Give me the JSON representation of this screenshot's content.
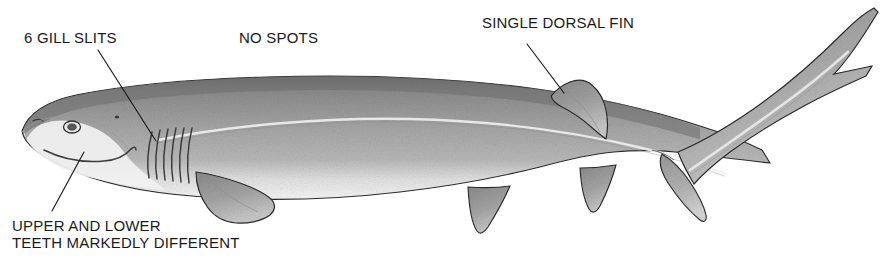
{
  "figure": {
    "type": "scientific-illustration",
    "orientation": "lateral-left-facing",
    "background_color": "#ffffff",
    "ink_color": "#1a1a1a",
    "body_fill_dark": "#8e8e8e",
    "body_fill_mid": "#a9a9a9",
    "body_fill_light": "#d8d8d8",
    "belly_fill": "#f2f2f2",
    "outline_color": "#2b2b2b",
    "canvas": {
      "width": 890,
      "height": 266
    }
  },
  "labels": {
    "gill_slits": "6 GILL SLITS",
    "no_spots": "NO SPOTS",
    "dorsal_fin": "SINGLE DORSAL FIN",
    "teeth_line1": "UPPER AND LOWER",
    "teeth_line2": "TEETH MARKEDLY DIFFERENT"
  },
  "leader_lines": [
    {
      "name": "gill-slits-leader",
      "from": [
        98,
        50
      ],
      "to": [
        156,
        141
      ]
    },
    {
      "name": "dorsal-fin-leader",
      "from": [
        527,
        44
      ],
      "to": [
        564,
        93
      ]
    },
    {
      "name": "teeth-leader",
      "from": [
        52,
        211
      ],
      "to": [
        84,
        152
      ]
    }
  ],
  "anatomy": {
    "gill_slit_count": 6,
    "dorsal_fin_count": 1,
    "features": [
      "snout",
      "eye",
      "spiracle",
      "mouth",
      "six-gill-slits",
      "pectoral-fin",
      "lateral-line",
      "single-dorsal-fin",
      "pelvic-fin",
      "anal-fin",
      "caudal-fin-upper-lobe",
      "caudal-fin-lower-lobe",
      "caudal-notch"
    ]
  }
}
